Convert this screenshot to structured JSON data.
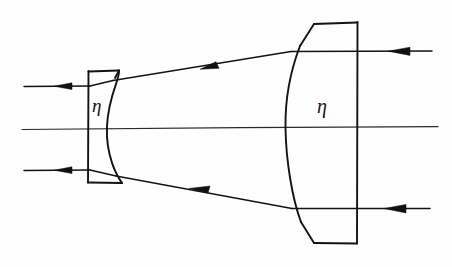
{
  "figure": {
    "background_color": "#fefefe",
    "ink_color": "#131313",
    "width": 452,
    "height": 267
  },
  "labels": {
    "left_lens_index": "η",
    "right_lens_index": "η"
  },
  "optical_axis": {
    "name": "optical-axis",
    "y": 128,
    "x_start": 22,
    "x_end": 438
  },
  "elements": [
    {
      "id": "left-lens",
      "type": "plano-concave-lens",
      "flat_face": "left",
      "curved_face": "right",
      "x_flat": 88,
      "x_edge": 118,
      "y_top": 71,
      "y_bottom": 182,
      "index_label": "η"
    },
    {
      "id": "right-lens",
      "type": "plano-convex-lens",
      "flat_face": "right",
      "curved_face": "left",
      "x_flat": 357,
      "x_vertex": 296,
      "y_top": 22,
      "y_bottom": 243,
      "index_label": "η"
    }
  ],
  "rays": [
    {
      "id": "ray-upper",
      "description": "upper incoming parallel ray",
      "points": [
        [
          24,
          86
        ],
        [
          88,
          86
        ],
        [
          118,
          80
        ],
        [
          312,
          51
        ],
        [
          358,
          51
        ],
        [
          432,
          51
        ]
      ],
      "arrowheads": [
        {
          "x": 62,
          "y": 86,
          "angle": 0
        },
        {
          "x": 216,
          "y": 66,
          "angle": -8.5
        },
        {
          "x": 402,
          "y": 51,
          "angle": 0
        }
      ]
    },
    {
      "id": "ray-lower",
      "description": "lower incoming parallel ray",
      "points": [
        [
          24,
          170
        ],
        [
          88,
          170
        ],
        [
          118,
          176
        ],
        [
          310,
          209
        ],
        [
          358,
          209
        ],
        [
          430,
          209
        ]
      ],
      "arrowheads": [
        {
          "x": 62,
          "y": 170,
          "angle": 0
        },
        {
          "x": 205,
          "y": 191,
          "angle": 9.6
        },
        {
          "x": 398,
          "y": 209,
          "angle": 0
        }
      ]
    }
  ],
  "annotations": {
    "eta_left": {
      "x": 94,
      "y": 111,
      "text": "η"
    },
    "eta_right": {
      "x": 318,
      "y": 112,
      "text": "η"
    }
  }
}
